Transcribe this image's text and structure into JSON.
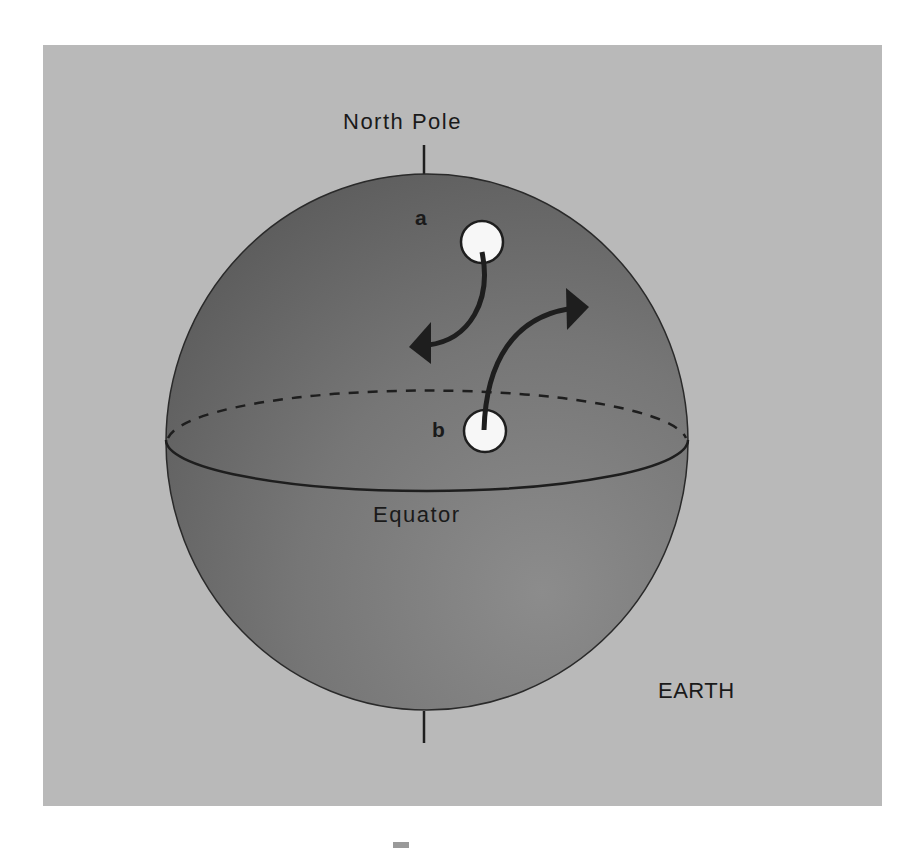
{
  "diagram": {
    "labels": {
      "north_pole": "North Pole",
      "equator": "Equator",
      "earth": "EARTH",
      "point_a": "a",
      "point_b": "b"
    },
    "colors": {
      "background_panel": "#b9b9b9",
      "sphere_dark": "#626262",
      "sphere_light": "#8c8c8c",
      "outline": "#1e1e1e",
      "marker_fill": "#f7f7f7",
      "arrow": "#1e1e1e"
    },
    "elements": {
      "sphere": {
        "cx": 427,
        "cy": 442,
        "rx": 261,
        "ry": 268
      },
      "axis_top": {
        "x": 424,
        "y1": 145,
        "y2": 174
      },
      "axis_bottom": {
        "x": 424,
        "y1": 711,
        "y2": 743
      },
      "equator_ellipse": {
        "cx": 427,
        "cy": 440,
        "rx": 261,
        "ry": 52
      },
      "marker_a": {
        "cx": 482,
        "cy": 242,
        "r": 22,
        "arrow_direction": "curves down-left toward equator (deflected west)"
      },
      "marker_b": {
        "cx": 485,
        "cy": 431,
        "r": 22,
        "arrow_direction": "curves up-right toward pole (deflected east)"
      }
    }
  }
}
